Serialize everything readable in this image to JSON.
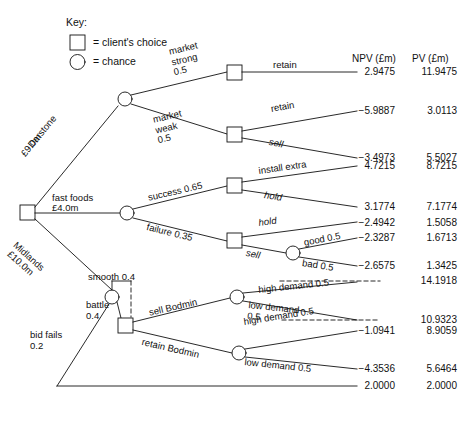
{
  "figure": {
    "type": "decision-tree",
    "key": {
      "title": "Key:",
      "square_label": "= client's choice",
      "circle_label": "= chance"
    },
    "columns": {
      "npv_header": "NPV (£m)",
      "pv_header": "PV (£m)"
    },
    "root_branches": [
      {
        "label_line1": "Darstone",
        "label_line2": "£9.0m"
      },
      {
        "label_line1": "fast foods",
        "label_line2": "£4.0m"
      },
      {
        "label_line1": "Midlands",
        "label_line2": "£10.0m"
      }
    ],
    "branch_labels": {
      "market_strong": "market\nstrong\n0.5",
      "market_weak": "market\nweak\n0.5",
      "retain_top": "retain",
      "retain_weak": "retain",
      "sell_weak": "sell",
      "success": "success 0.65",
      "failure": "failure 0.35",
      "install_extra": "install extra",
      "hold_success": "hold",
      "hold_failure": "hold",
      "sell_failure": "sell",
      "good": "good 0.5",
      "bad": "bad 0.5",
      "smooth": "smooth 0.4",
      "battle": "battle\n0.4",
      "bid_fails": "bid fails\n0.2",
      "sell_bodmin": "sell Bodmin",
      "retain_bodmin": "retain Bodmin",
      "high_demand_1": "high demand 0.5",
      "low_demand_1": "low demand\n0.5",
      "high_demand_2": "high demand 0.5",
      "low_demand_2": "low demand 0.5"
    },
    "outcomes": [
      {
        "id": "o1",
        "npv": "2.9475",
        "pv": "11.9475"
      },
      {
        "id": "o2",
        "npv": "−5.9887",
        "pv": "3.0113"
      },
      {
        "id": "o3",
        "npv": "−3.4973",
        "pv": "5.5027"
      },
      {
        "id": "o4",
        "npv": "4.7215",
        "pv": "8.7215"
      },
      {
        "id": "o5",
        "npv": "3.1774",
        "pv": "7.1774"
      },
      {
        "id": "o6",
        "npv": "−2.4942",
        "pv": "1.5058"
      },
      {
        "id": "o7",
        "npv": "−2.3287",
        "pv": "1.6713"
      },
      {
        "id": "o8",
        "npv": "−2.6575",
        "pv": "1.3425"
      },
      {
        "id": "o9",
        "npv": "",
        "pv": "14.1918"
      },
      {
        "id": "o10",
        "npv": "",
        "pv": "10.9323"
      },
      {
        "id": "o11",
        "npv": "−1.0941",
        "pv": "8.9059"
      },
      {
        "id": "o12",
        "npv": "−4.3536",
        "pv": "5.6464"
      },
      {
        "id": "o13",
        "npv": "2.0000",
        "pv": "2.0000"
      }
    ]
  }
}
